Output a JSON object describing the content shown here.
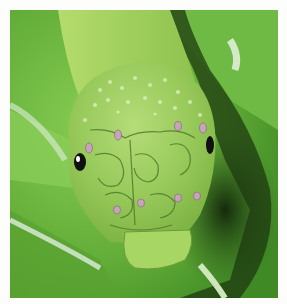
{
  "image": {
    "subject": "green caterpillar head close-up on leaves",
    "colors": {
      "border": "#fdfdfb",
      "leaf_bright": "#7cc64a",
      "leaf_mid": "#5aa832",
      "shadow": "#1f3a12",
      "body": "#a6d45a",
      "head": "#95c956",
      "head_light": "#c2e08a",
      "pattern_line": "#4f7a2a",
      "spot": "#c9a4b8",
      "eye": "#111111"
    }
  }
}
